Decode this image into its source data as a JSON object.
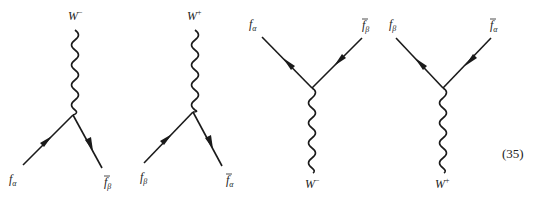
{
  "figure": {
    "equation_number": "(35)",
    "diagrams": [
      {
        "boson": {
          "base": "W",
          "charge": "−"
        },
        "fermion_in": {
          "base": "f",
          "sub": "α",
          "bar": false
        },
        "fermion_out": {
          "base": "f",
          "sub": "β",
          "bar": true
        }
      },
      {
        "boson": {
          "base": "W",
          "charge": "+"
        },
        "fermion_in": {
          "base": "f",
          "sub": "β",
          "bar": false
        },
        "fermion_out": {
          "base": "f",
          "sub": "α",
          "bar": true
        }
      },
      {
        "boson": {
          "base": "W",
          "charge": "−"
        },
        "fermion_left": {
          "base": "f",
          "sub": "α",
          "bar": false
        },
        "fermion_right": {
          "base": "f",
          "sub": "β",
          "bar": true
        }
      },
      {
        "boson": {
          "base": "W",
          "charge": "+"
        },
        "fermion_left": {
          "base": "f",
          "sub": "β",
          "bar": false
        },
        "fermion_right": {
          "base": "f",
          "sub": "α",
          "bar": true
        }
      }
    ]
  }
}
